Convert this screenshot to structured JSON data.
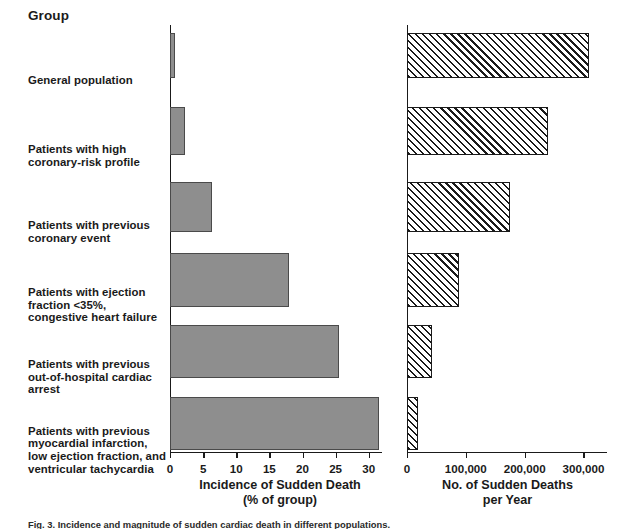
{
  "figure": {
    "group_header": "Group",
    "caption": "Fig. 3. Incidence and magnitude of sudden cardiac death in different populations."
  },
  "chart_data": {
    "type": "bar",
    "title": "",
    "orientation": "horizontal",
    "categories": [
      "General population",
      "Patients with high coronary-risk profile",
      "Patients with previous coronary event",
      "Patients with ejection fraction <35%, congestive heart failure",
      "Patients with previous out-of-hospital cardiac arrest",
      "Patients with previous myocardial infarction, low ejection fraction, and ventricular tachycardia"
    ],
    "category_lines": [
      [
        "General population"
      ],
      [
        "Patients with high",
        "coronary-risk profile"
      ],
      [
        "Patients with previous",
        "coronary event"
      ],
      [
        "Patients with ejection",
        "fraction <35%,",
        "congestive heart failure"
      ],
      [
        "Patients with previous",
        "out-of-hospital cardiac",
        "arrest"
      ],
      [
        "Patients with previous",
        "myocardial infarction,",
        "low ejection fraction, and",
        "ventricular tachycardia"
      ]
    ],
    "panels": [
      {
        "id": "incidence",
        "xlabel_lines": [
          "Incidence of Sudden Death",
          "(% of group)"
        ],
        "xlabel": "Incidence of Sudden Death (% of group)",
        "xlim": [
          0,
          32
        ],
        "xticks": [
          0,
          5,
          10,
          15,
          20,
          25,
          30
        ],
        "xtick_labels": [
          "0",
          "5",
          "10",
          "15",
          "20",
          "25",
          "30"
        ],
        "bar_style": "solid-gray",
        "bar_color": "#8e8e8e",
        "values": [
          0.8,
          2.3,
          6.3,
          18.0,
          25.5,
          31.5
        ],
        "grid": false
      },
      {
        "id": "deaths-per-year",
        "xlabel_lines": [
          "No. of Sudden Deaths",
          "per Year"
        ],
        "xlabel": "No. of Sudden Deaths per Year",
        "xlim": [
          0,
          340000
        ],
        "xticks": [
          0,
          100000,
          200000,
          300000
        ],
        "xtick_labels": [
          "0",
          "100,000",
          "200,000",
          "300,000"
        ],
        "bar_style": "diagonal-hatch",
        "bar_color": "#1a1a1a",
        "values": [
          310000,
          240000,
          175000,
          88000,
          42000,
          18000
        ],
        "grid": false
      }
    ],
    "legend": null
  }
}
